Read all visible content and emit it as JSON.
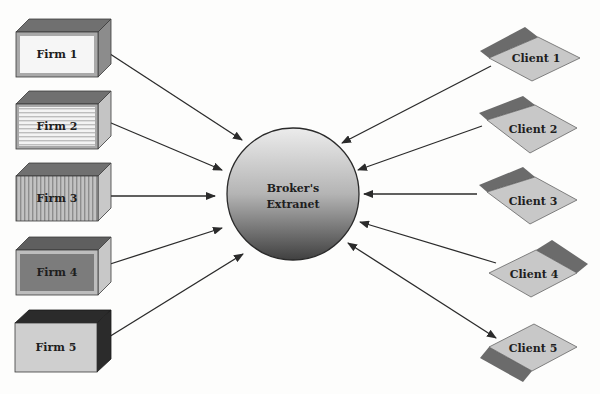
{
  "diagram": {
    "hub": {
      "label_line1": "Broker's",
      "label_line2": "Extranet"
    },
    "firms": [
      {
        "label": "Firm 1",
        "face_style": "white-with-gray-border"
      },
      {
        "label": "Firm 2",
        "face_style": "horizontal-stripes"
      },
      {
        "label": "Firm 3",
        "face_style": "vertical-stripes"
      },
      {
        "label": "Firm 4",
        "face_style": "dark-gray-inset"
      },
      {
        "label": "Firm 5",
        "face_style": "light-gray-dark-sides"
      }
    ],
    "clients": [
      {
        "label": "Client 1",
        "accent": "top-left"
      },
      {
        "label": "Client 2",
        "accent": "top-left"
      },
      {
        "label": "Client 3",
        "accent": "top-left"
      },
      {
        "label": "Client 4",
        "accent": "top-right"
      },
      {
        "label": "Client 5",
        "accent": "bottom-left"
      }
    ],
    "connections": [
      {
        "from": "Firm 1",
        "to": "Broker's Extranet",
        "direction": "to-hub"
      },
      {
        "from": "Firm 2",
        "to": "Broker's Extranet",
        "direction": "to-hub"
      },
      {
        "from": "Firm 3",
        "to": "Broker's Extranet",
        "direction": "to-hub"
      },
      {
        "from": "Firm 4",
        "to": "Broker's Extranet",
        "direction": "to-hub"
      },
      {
        "from": "Firm 5",
        "to": "Broker's Extranet",
        "direction": "to-hub"
      },
      {
        "from": "Client 1",
        "to": "Broker's Extranet",
        "direction": "to-hub"
      },
      {
        "from": "Client 2",
        "to": "Broker's Extranet",
        "direction": "to-hub"
      },
      {
        "from": "Client 3",
        "to": "Broker's Extranet",
        "direction": "to-hub"
      },
      {
        "from": "Client 4",
        "to": "Broker's Extranet",
        "direction": "to-hub"
      },
      {
        "from": "Client 5",
        "to": "Broker's Extranet",
        "direction": "bidirectional"
      }
    ],
    "colors": {
      "box_top": "#6f6f6f",
      "box_side": "#8a8a8a",
      "box_face": "#c9c9c9",
      "dark": "#2a2a2a",
      "diamond_fill": "#c8c8c8",
      "diamond_accent": "#6b6b6b",
      "line": "#2b2b2b"
    }
  }
}
